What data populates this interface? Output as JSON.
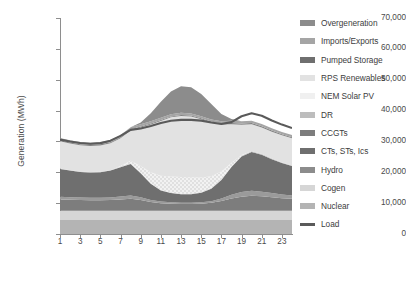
{
  "chart_data": {
    "type": "area",
    "title": "",
    "xlabel": "",
    "ylabel": "Generation (MWh)",
    "ylim": [
      0,
      70000
    ],
    "xlim": [
      1,
      24
    ],
    "grid": false,
    "legend_position": "right",
    "stacked": true,
    "x": [
      1,
      2,
      3,
      4,
      5,
      6,
      7,
      8,
      9,
      10,
      11,
      12,
      13,
      14,
      15,
      16,
      17,
      18,
      19,
      20,
      21,
      22,
      23,
      24
    ],
    "xticks": [
      1,
      3,
      5,
      7,
      9,
      11,
      13,
      15,
      17,
      19,
      21,
      23
    ],
    "xtick_labels": [
      "1",
      "3",
      "5",
      "7",
      "9",
      "11",
      "13",
      "15",
      "17",
      "19",
      "21",
      "23"
    ],
    "yticks": [
      0,
      10000,
      20000,
      30000,
      40000,
      50000,
      60000,
      70000
    ],
    "ytick_labels": [
      "0",
      "10,000",
      "20,000",
      "30,000",
      "40,000",
      "50,000",
      "60,000",
      "70,000"
    ],
    "series": [
      {
        "name": "Nuclear",
        "color": "#b4b4b4",
        "values": [
          4500,
          4500,
          4500,
          4500,
          4500,
          4500,
          4500,
          4500,
          4500,
          4500,
          4500,
          4500,
          4500,
          4500,
          4500,
          4500,
          4500,
          4500,
          4500,
          4500,
          4500,
          4500,
          4500,
          4500
        ]
      },
      {
        "name": "Cogen",
        "color": "#d6d6d6",
        "values": [
          3000,
          3000,
          3000,
          3000,
          3000,
          3000,
          3000,
          3000,
          3000,
          3000,
          3000,
          3000,
          3000,
          3000,
          3000,
          3000,
          3000,
          3000,
          3000,
          3000,
          3000,
          3000,
          3000,
          3000
        ]
      },
      {
        "name": "Hydro",
        "color": "#7d7d7d",
        "values": [
          3700,
          3600,
          3500,
          3450,
          3450,
          3500,
          3700,
          3900,
          3500,
          2900,
          2500,
          2300,
          2200,
          2200,
          2300,
          2600,
          3200,
          4000,
          4600,
          4900,
          4700,
          4400,
          4100,
          3900
        ]
      },
      {
        "name": "CTs, STs, Ics",
        "color": "#9a9a9a",
        "values": [
          900,
          850,
          800,
          800,
          800,
          850,
          950,
          1100,
          900,
          650,
          500,
          450,
          420,
          420,
          450,
          550,
          800,
          1200,
          1500,
          1600,
          1500,
          1350,
          1200,
          1050
        ]
      },
      {
        "name": "CCGTs",
        "color": "#6f6f6f",
        "values": [
          9000,
          8600,
          8300,
          8200,
          8300,
          8700,
          9500,
          10200,
          7800,
          5200,
          3600,
          3000,
          2800,
          2800,
          3100,
          4000,
          6000,
          9000,
          11500,
          12600,
          12000,
          11000,
          10200,
          9600
        ]
      },
      {
        "name": "DR",
        "color": "#bdbdbd",
        "values": [
          150,
          150,
          150,
          150,
          150,
          150,
          150,
          150,
          150,
          150,
          150,
          150,
          150,
          150,
          150,
          150,
          150,
          200,
          250,
          250,
          220,
          200,
          180,
          160
        ]
      },
      {
        "name": "NEM Solar PV",
        "color": "#ededed",
        "hatched": true,
        "values": [
          0,
          0,
          0,
          0,
          0,
          0,
          200,
          900,
          2200,
          3600,
          4600,
          5200,
          5400,
          5300,
          4800,
          3900,
          2600,
          1200,
          250,
          0,
          0,
          0,
          0,
          0
        ]
      },
      {
        "name": "RPS Renewables",
        "color": "#e2e2e2",
        "values": [
          8800,
          8600,
          8500,
          8400,
          8500,
          8700,
          9000,
          9800,
          12500,
          15500,
          17800,
          19200,
          19800,
          19700,
          18900,
          17400,
          15200,
          12500,
          9800,
          8700,
          8600,
          8700,
          8800,
          8800
        ]
      },
      {
        "name": "Pumped Storage",
        "color": "#838383",
        "values": [
          350,
          350,
          350,
          350,
          350,
          350,
          350,
          350,
          300,
          300,
          300,
          300,
          300,
          300,
          300,
          300,
          350,
          400,
          450,
          450,
          420,
          400,
          380,
          360
        ]
      },
      {
        "name": "Imports/Exports",
        "color": "#a5a5a5",
        "values": [
          700,
          700,
          700,
          700,
          700,
          700,
          700,
          700,
          700,
          700,
          700,
          700,
          700,
          700,
          700,
          700,
          700,
          700,
          700,
          700,
          700,
          700,
          700,
          700
        ]
      },
      {
        "name": "Overgeneration",
        "color": "#8c8c8c",
        "values": [
          0,
          0,
          0,
          0,
          0,
          0,
          0,
          0,
          600,
          2600,
          5200,
          7400,
          8600,
          8500,
          7200,
          5000,
          2400,
          600,
          0,
          0,
          0,
          0,
          0,
          0
        ]
      }
    ],
    "load_line": {
      "name": "Load",
      "color": "#5a5a5a",
      "values": [
        30600,
        29950,
        29500,
        29250,
        29450,
        30250,
        31800,
        33750,
        34200,
        35000,
        36000,
        36700,
        37000,
        37000,
        36750,
        36150,
        35650,
        36250,
        38150,
        39150,
        38300,
        36800,
        35450,
        34350
      ]
    }
  },
  "legend": {
    "items": [
      {
        "label": "Overgeneration",
        "color": "#8c8c8c",
        "style": "swatch"
      },
      {
        "label": "Imports/Exports",
        "color": "#a5a5a5",
        "style": "swatch"
      },
      {
        "label": "Pumped Storage",
        "color": "#6f6f6f",
        "style": "swatch"
      },
      {
        "label": "RPS Renewables",
        "color": "#e2e2e2",
        "style": "swatch"
      },
      {
        "label": "NEM Solar PV",
        "color": "#f0f0f0",
        "style": "swatch"
      },
      {
        "label": "DR",
        "color": "#bdbdbd",
        "style": "swatch"
      },
      {
        "label": "CCGTs",
        "color": "#7d7d7d",
        "style": "swatch"
      },
      {
        "label": "CTs, STs, Ics",
        "color": "#6f6f6f",
        "style": "swatch"
      },
      {
        "label": "Hydro",
        "color": "#8c8c8c",
        "style": "swatch"
      },
      {
        "label": "Cogen",
        "color": "#d6d6d6",
        "style": "swatch"
      },
      {
        "label": "Nuclear",
        "color": "#b4b4b4",
        "style": "swatch"
      },
      {
        "label": "Load",
        "color": "#5a5a5a",
        "style": "line"
      }
    ]
  }
}
